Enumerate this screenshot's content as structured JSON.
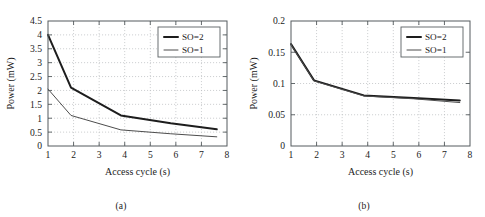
{
  "figure": {
    "panels": [
      {
        "id": "a",
        "caption": "(a)",
        "chart_data": {
          "type": "line",
          "title": "",
          "xlabel": "Access cycle (s)",
          "ylabel": "Power (mW)",
          "xlim": [
            1,
            8
          ],
          "ylim": [
            0,
            4.5
          ],
          "xticks": [
            1,
            2,
            3,
            4,
            5,
            6,
            7,
            8
          ],
          "xticklabels": [
            "1",
            "2",
            "3",
            "4",
            "5",
            "6",
            "7",
            "8"
          ],
          "yticks": [
            0,
            0.5,
            1,
            1.5,
            2,
            2.5,
            3,
            3.5,
            4,
            4.5
          ],
          "yticklabels": [
            "0",
            "0.5",
            "1",
            "1.5",
            "2",
            "2.5",
            "3",
            "3.5",
            "4",
            "4.5"
          ],
          "grid": true,
          "legend_position": "upper right",
          "series": [
            {
              "name": "SO=2",
              "style": "thick",
              "x": [
                1.0,
                1.9,
                3.85,
                5.8,
                7.6
              ],
              "values": [
                4.0,
                2.1,
                1.1,
                0.82,
                0.6
              ]
            },
            {
              "name": "SO=1",
              "style": "thin",
              "x": [
                1.0,
                1.9,
                3.85,
                5.8,
                7.6
              ],
              "values": [
                2.05,
                1.1,
                0.58,
                0.44,
                0.33
              ]
            }
          ]
        }
      },
      {
        "id": "b",
        "caption": "(b)",
        "chart_data": {
          "type": "line",
          "title": "",
          "xlabel": "Access cycle (s)",
          "ylabel": "Power (mW)",
          "xlim": [
            1,
            8
          ],
          "ylim": [
            0,
            0.2
          ],
          "xticks": [
            1,
            2,
            3,
            4,
            5,
            6,
            7,
            8
          ],
          "xticklabels": [
            "1",
            "2",
            "3",
            "4",
            "5",
            "6",
            "7",
            "8"
          ],
          "yticks": [
            0,
            0.05,
            0.1,
            0.15,
            0.2
          ],
          "yticklabels": [
            "0",
            "0.05",
            "0.1",
            "0.15",
            "0.2"
          ],
          "grid": true,
          "legend_position": "upper right",
          "series": [
            {
              "name": "SO=2",
              "style": "thick",
              "x": [
                1.0,
                1.9,
                3.85,
                5.8,
                7.6
              ],
              "values": [
                0.163,
                0.105,
                0.081,
                0.077,
                0.073
              ]
            },
            {
              "name": "SO=1",
              "style": "thin",
              "x": [
                1.0,
                1.9,
                3.85,
                5.8,
                7.6
              ],
              "values": [
                0.162,
                0.104,
                0.08,
                0.0755,
                0.0695
              ]
            }
          ]
        }
      }
    ],
    "colors": {
      "series_thick": "#1d1d1d",
      "series_thin": "#4d4d4d",
      "frame": "#555b5e",
      "grid": "#b9bcbe",
      "background": "#ffffff"
    }
  }
}
